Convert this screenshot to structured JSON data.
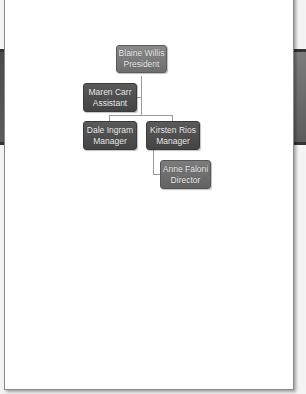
{
  "org_chart": {
    "nodes": [
      {
        "id": "president",
        "name": "Blaine Willis",
        "title": "President"
      },
      {
        "id": "assistant",
        "name": "Maren Carr",
        "title": "Assistant",
        "reports_to": "president"
      },
      {
        "id": "manager1",
        "name": "Dale Ingram",
        "title": "Manager",
        "reports_to": "president"
      },
      {
        "id": "manager2",
        "name": "Kirsten Rios",
        "title": "Manager",
        "reports_to": "president"
      },
      {
        "id": "director",
        "name": "Anne Faloni",
        "title": "Director",
        "reports_to": "manager2"
      }
    ]
  },
  "colors": {
    "page": "#ffffff",
    "node_top": "#7c7c7c",
    "node_mid": "#4e4e4e",
    "node_leaf": "#6e6e6e",
    "connector": "#9a9a9a",
    "node_text": "#f2f2f2"
  }
}
